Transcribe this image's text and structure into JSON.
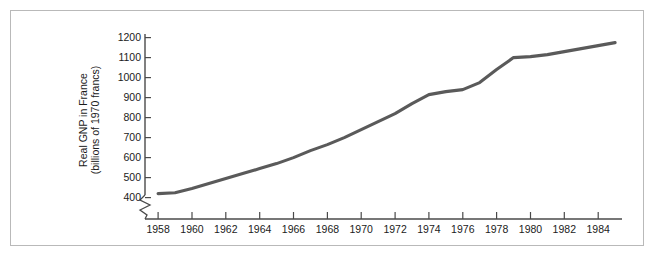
{
  "figure": {
    "border_color": "#b9b9b9",
    "background": "#ffffff"
  },
  "chart_data": {
    "type": "line",
    "title": "",
    "xlabel": "",
    "ylabel": "Real GNP in France (billions of 1970 francs)",
    "ylabel_line1": "Real GNP in France",
    "ylabel_line2": "(billions of 1970 francs)",
    "series_color": "#5a5a5a",
    "axis_color": "#4a4a4a",
    "grid": false,
    "legend": null,
    "axis_break": true,
    "axis_break_note": "zigzag break on y-axis below 400",
    "xlim": [
      1957.4,
      1985.6
    ],
    "ylim": [
      400,
      1240
    ],
    "yticks": [
      400,
      500,
      600,
      700,
      800,
      900,
      1000,
      1100,
      1200
    ],
    "ytick_labels": [
      "400",
      "500",
      "600",
      "700",
      "800",
      "900",
      "1000",
      "1100",
      "1200"
    ],
    "xticks": [
      1958,
      1960,
      1962,
      1964,
      1966,
      1968,
      1970,
      1972,
      1974,
      1976,
      1978,
      1980,
      1982,
      1984
    ],
    "xtick_labels": [
      "1958",
      "1960",
      "1962",
      "1964",
      "1966",
      "1968",
      "1970",
      "1972",
      "1974",
      "1976",
      "1978",
      "1980",
      "1982",
      "1984"
    ],
    "x": [
      1958,
      1959,
      1960,
      1961,
      1962,
      1963,
      1964,
      1965,
      1966,
      1967,
      1968,
      1969,
      1970,
      1971,
      1972,
      1973,
      1974,
      1975,
      1976,
      1977,
      1978,
      1979,
      1980,
      1981,
      1982,
      1983,
      1984,
      1985
    ],
    "values": [
      420,
      424,
      445,
      470,
      495,
      520,
      545,
      570,
      600,
      635,
      665,
      700,
      740,
      780,
      820,
      870,
      915,
      930,
      940,
      975,
      1040,
      1100,
      1105,
      1115,
      1130,
      1145,
      1160,
      1175
    ]
  }
}
